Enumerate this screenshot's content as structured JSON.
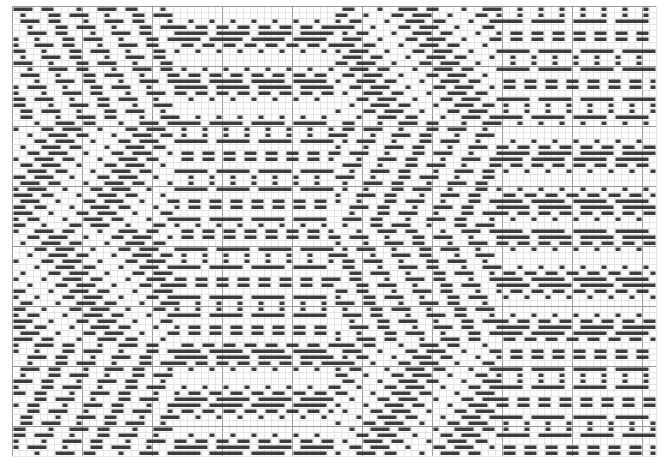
{
  "draft": {
    "type": "weave-draft",
    "cols": 92,
    "rows": 75,
    "cell_w": 7,
    "cell_h": 6,
    "major_every": 10,
    "colors": {
      "background": "#ffffff",
      "grid_minor": "#d4d4d4",
      "grid_major": "#9a9a9a",
      "float": "#3c3c3c"
    },
    "pattern": {
      "style": "diamond-twill",
      "float_min": 2,
      "float_max": 5,
      "diamond_period_x": 46,
      "diamond_period_y": 37
    }
  }
}
